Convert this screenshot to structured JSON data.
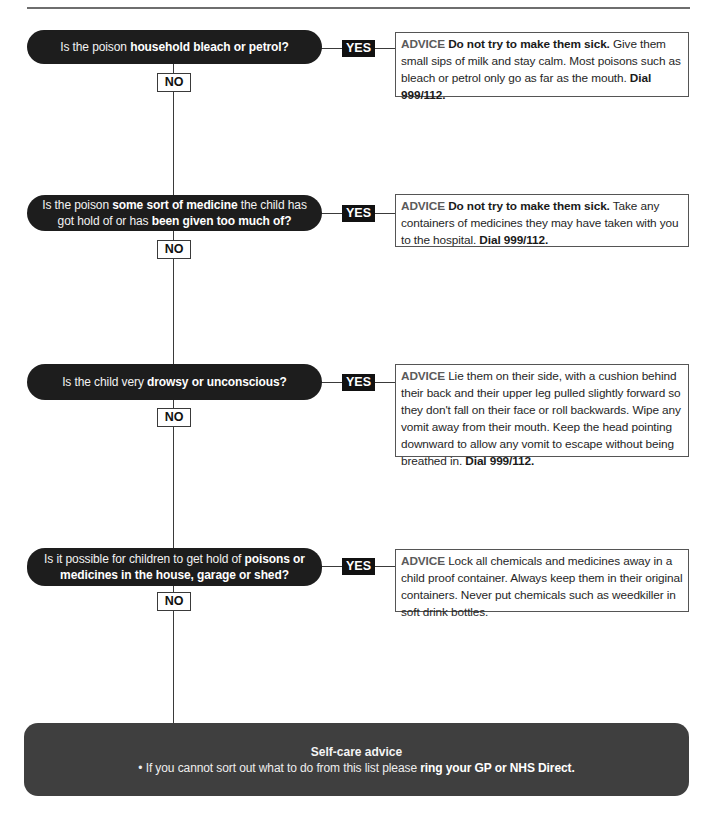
{
  "steps": [
    {
      "question": [
        {
          "text": "Is the poison "
        },
        {
          "text": "household bleach or petrol?"
        }
      ],
      "yes_label": "YES",
      "no_label": "NO",
      "advice": {
        "label": "ADVICE",
        "segments": [
          {
            "text": " Do not try to make them sick."
          },
          {
            "text": " Give them small sips of milk and stay calm. Most poisons such as bleach or petrol only go as far as the mouth."
          },
          {
            "text": " Dial 999/112."
          }
        ]
      }
    },
    {
      "question": [
        {
          "text": "Is the poison "
        },
        {
          "text": "some sort of medicine"
        },
        {
          "text": " the child has got hold of or has "
        },
        {
          "text": "been given too much of?"
        }
      ],
      "yes_label": "YES",
      "no_label": "NO",
      "advice": {
        "label": "ADVICE",
        "segments": [
          {
            "text": " Do not try to make them sick."
          },
          {
            "text": " Take any containers of medicines they may have taken with you to the hospital."
          },
          {
            "text": " Dial 999/112."
          }
        ]
      }
    },
    {
      "question": [
        {
          "text": "Is the child very "
        },
        {
          "text": "drowsy or unconscious?"
        }
      ],
      "yes_label": "YES",
      "no_label": "NO",
      "advice": {
        "label": "ADVICE",
        "segments": [
          {
            "text": " Lie them on their side, with a cushion behind their back and their upper leg pulled slightly forward so they don't fall on their face or roll backwards. Wipe any vomit away from their mouth. Keep the head pointing downward to allow any vomit to escape without being breathed in."
          },
          {
            "text": " Dial 999/112."
          }
        ]
      }
    },
    {
      "question": [
        {
          "text": "Is it possible for children to get hold of "
        },
        {
          "text": "poisons or medicines in the house, garage or shed?"
        }
      ],
      "yes_label": "YES",
      "no_label": "NO",
      "advice": {
        "label": "ADVICE",
        "segments": [
          {
            "text": " Lock all chemicals and medicines away in a child proof container. Always keep them in their original containers. Never put chemicals such as weedkiller in soft drink bottles."
          }
        ]
      }
    }
  ],
  "self_care": {
    "title": "Self-care advice",
    "bullet": "•",
    "text": " If you cannot sort out what to do from this list please ",
    "text_bold": "ring your GP or NHS Direct."
  },
  "colors": {
    "question_pill": "#1d1d1d",
    "yes_badge": "#111111",
    "self_care_box": "#3f3f3f",
    "connector": "#3a3a3a"
  }
}
